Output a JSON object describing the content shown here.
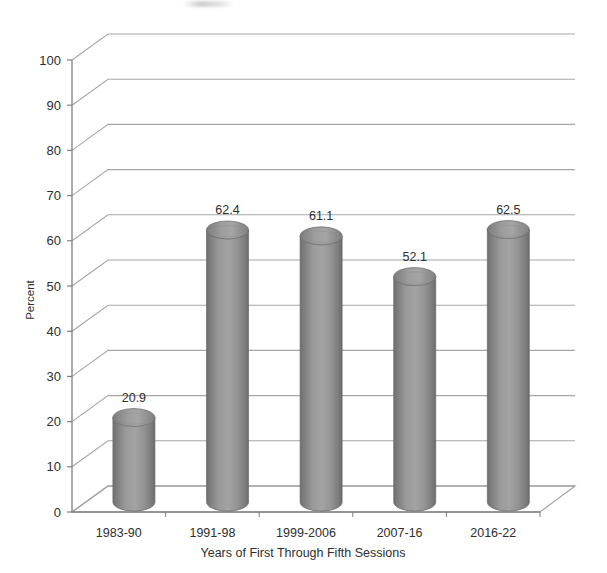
{
  "chart_data": {
    "type": "bar",
    "title": "",
    "subtitle": "",
    "xlabel": "Years of First Through Fifth Sessions",
    "ylabel": "Percent",
    "categories": [
      "1983-90",
      "1991-98",
      "1999-2006",
      "2007-16",
      "2016-22"
    ],
    "values": [
      20.9,
      62.4,
      61.1,
      52.1,
      62.5
    ],
    "data_labels": [
      "20.9",
      "62.4",
      "61.1",
      "52.1",
      "62.5"
    ],
    "ylim": [
      0,
      100
    ],
    "ytick_step": 10,
    "ytick_labels": [
      "0",
      "10",
      "20",
      "30",
      "40",
      "50",
      "60",
      "70",
      "80",
      "90",
      "100"
    ],
    "grid": true,
    "grid_orientation": "horizontal",
    "legend": "none",
    "style": "3d-cylinder",
    "bar_color": "#8a8a8a",
    "bar_color_dark": "#6f6f6f",
    "bar_color_light": "#a8a8a8",
    "grid_color": "#a6a6a6",
    "axis_color": "#7f7f7f",
    "text_color": "#2e2e2e",
    "background": "#ffffff"
  },
  "axes": {
    "y_axis_title": "Percent",
    "x_axis_title": "Years of First Through Fifth Sessions"
  }
}
